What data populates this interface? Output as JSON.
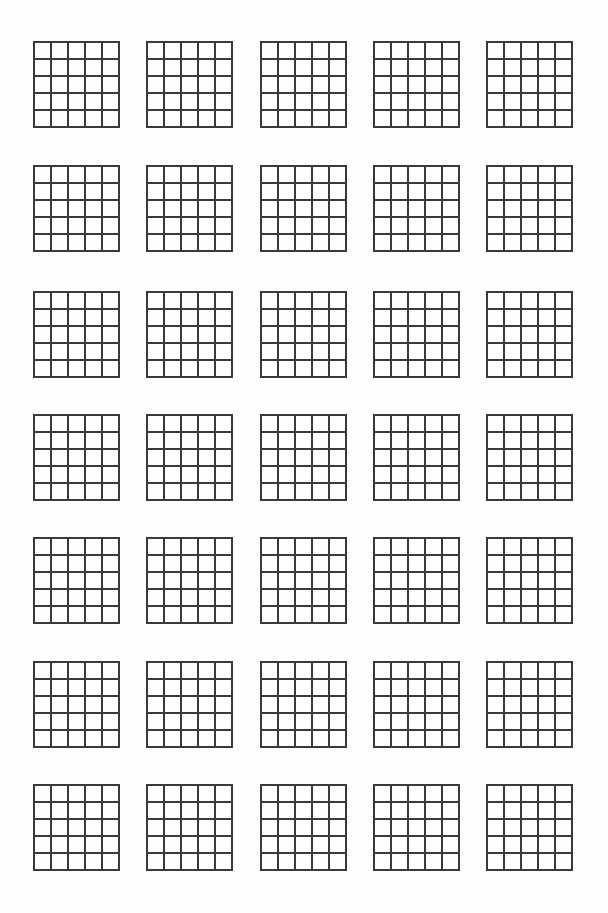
{
  "page": {
    "type": "blank-grid-worksheet",
    "background_color": "#fdfdfd",
    "line_color": "#3a3a3a"
  },
  "layout": {
    "rows": 7,
    "columns": 5,
    "grid_size_px": 85,
    "cells_per_side": 5,
    "column_x": [
      34,
      147,
      261,
      374,
      487
    ],
    "row_y": [
      42,
      166,
      292,
      415,
      538,
      662,
      785
    ]
  },
  "grids": {
    "count": 35,
    "cell_rows": 5,
    "cell_cols": 5,
    "content": "empty"
  }
}
